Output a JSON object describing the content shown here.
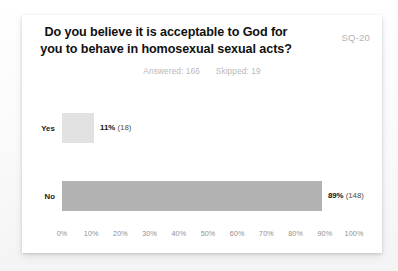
{
  "card": {
    "title_line_1": "Do you believe it is acceptable to God for",
    "title_line_2": "you to behave in homosexual sexual acts?",
    "badge": "SQ-20",
    "answered_label": "Answered: 166",
    "skipped_label": "Skipped: 19"
  },
  "colors": {
    "card_background": "#ffffff",
    "page_background": "#fbfbfb",
    "bar_yes": "#e2e2e2",
    "bar_no": "#b2b2b2",
    "title_text": "#111111",
    "muted_text": "#b9b9b9",
    "axis_text": "#8f8f8f"
  },
  "chart_data": {
    "type": "bar",
    "orientation": "horizontal",
    "title": "Do you believe it is acceptable to God for you to behave in homosexual sexual acts?",
    "xlabel": "",
    "ylabel": "",
    "xlim": [
      0,
      100
    ],
    "grid": false,
    "legend": "none",
    "categories": [
      "Yes",
      "No"
    ],
    "values": [
      11,
      89
    ],
    "counts": [
      18,
      148
    ],
    "value_labels": [
      "11%",
      "89%"
    ],
    "count_labels": [
      "(18)",
      "(148)"
    ],
    "tick_labels": [
      "0%",
      "10%",
      "20%",
      "30%",
      "40%",
      "50%",
      "60%",
      "70%",
      "80%",
      "90%",
      "100%"
    ],
    "tick_values": [
      0,
      10,
      20,
      30,
      40,
      50,
      60,
      70,
      80,
      90,
      100
    ],
    "answered": 166,
    "skipped": 19
  }
}
